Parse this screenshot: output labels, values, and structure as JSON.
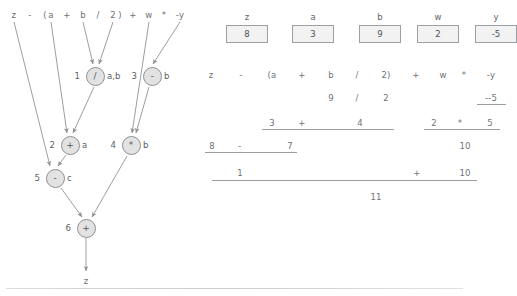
{
  "expression": {
    "text": "z - (a + b / 2) + w * -y",
    "tokens": [
      {
        "text": "z",
        "x": 14,
        "y": 15
      },
      {
        "text": "-",
        "x": 30,
        "y": 15
      },
      {
        "text": "(",
        "x": 45,
        "y": 15
      },
      {
        "text": "a",
        "x": 51,
        "y": 15
      },
      {
        "text": "+",
        "x": 67,
        "y": 15
      },
      {
        "text": "b",
        "x": 83,
        "y": 15
      },
      {
        "text": "/",
        "x": 98,
        "y": 15
      },
      {
        "text": "2",
        "x": 113,
        "y": 15
      },
      {
        "text": ")",
        "x": 120,
        "y": 15
      },
      {
        "text": "+",
        "x": 133,
        "y": 15
      },
      {
        "text": "w",
        "x": 149,
        "y": 15
      },
      {
        "text": "*",
        "x": 164,
        "y": 15
      },
      {
        "text": "-y",
        "x": 180,
        "y": 15
      }
    ]
  },
  "graph": {
    "nodes": [
      {
        "index": "1",
        "op": "/",
        "label": "a,b",
        "x": 95,
        "y": 76
      },
      {
        "index": "2",
        "op": "+",
        "label": "a",
        "x": 70,
        "y": 145
      },
      {
        "index": "3",
        "op": "-",
        "label": "b",
        "x": 152,
        "y": 76
      },
      {
        "index": "4",
        "op": "*",
        "label": "b",
        "x": 131,
        "y": 145
      },
      {
        "index": "5",
        "op": "-",
        "label": "c",
        "x": 55,
        "y": 178
      },
      {
        "index": "6",
        "op": "+",
        "label": "",
        "x": 86,
        "y": 228
      }
    ],
    "output_label": "z"
  },
  "variables": [
    {
      "name": "z",
      "value": "8",
      "cx": 47
    },
    {
      "name": "a",
      "value": "3",
      "cx": 113
    },
    {
      "name": "b",
      "value": "9",
      "cx": 180
    },
    {
      "name": "w",
      "value": "2",
      "cx": 238
    },
    {
      "name": "y",
      "value": "-5",
      "cx": 296
    }
  ],
  "evaluation": {
    "rows": [
      {
        "name": "source-expression",
        "tokens": [
          {
            "text": "z",
            "x": 11,
            "y": 75
          },
          {
            "text": "-",
            "x": 41,
            "y": 75
          },
          {
            "text": "(a",
            "x": 72,
            "y": 75
          },
          {
            "text": "+",
            "x": 102,
            "y": 75
          },
          {
            "text": "b",
            "x": 131,
            "y": 75
          },
          {
            "text": "/",
            "x": 157,
            "y": 75
          },
          {
            "text": "2)",
            "x": 186,
            "y": 75
          },
          {
            "text": "+",
            "x": 216,
            "y": 75
          },
          {
            "text": "w",
            "x": 243,
            "y": 75
          },
          {
            "text": "*",
            "x": 264,
            "y": 75
          },
          {
            "text": "-y",
            "x": 291,
            "y": 75
          }
        ]
      },
      {
        "name": "step-1",
        "tokens": [
          {
            "text": "9",
            "x": 131,
            "y": 98
          },
          {
            "text": "/",
            "x": 157,
            "y": 98
          },
          {
            "text": "2",
            "x": 186,
            "y": 98
          },
          {
            "text": "--5",
            "x": 291,
            "y": 98
          }
        ],
        "rules": [
          {
            "x": 277,
            "y": 104,
            "w": 29
          }
        ]
      },
      {
        "name": "step-2",
        "tokens": [
          {
            "text": "3",
            "x": 72,
            "y": 123
          },
          {
            "text": "+",
            "x": 102,
            "y": 123
          },
          {
            "text": "4",
            "x": 160,
            "y": 123
          },
          {
            "text": "2",
            "x": 234,
            "y": 123
          },
          {
            "text": "*",
            "x": 260,
            "y": 123
          },
          {
            "text": "5",
            "x": 290,
            "y": 123
          }
        ],
        "rules": [
          {
            "x": 62,
            "y": 129,
            "w": 132
          },
          {
            "x": 224,
            "y": 129,
            "w": 76
          }
        ]
      },
      {
        "name": "step-3",
        "tokens": [
          {
            "text": "8",
            "x": 12,
            "y": 146
          },
          {
            "text": "-",
            "x": 40,
            "y": 146
          },
          {
            "text": "7",
            "x": 90,
            "y": 146
          },
          {
            "text": "10",
            "x": 265,
            "y": 146
          }
        ],
        "rules": [
          {
            "x": 5,
            "y": 152,
            "w": 92
          }
        ]
      },
      {
        "name": "step-4",
        "tokens": [
          {
            "text": "1",
            "x": 40,
            "y": 173
          },
          {
            "text": "+",
            "x": 217,
            "y": 173
          },
          {
            "text": "10",
            "x": 265,
            "y": 173
          }
        ],
        "rules": [
          {
            "x": 12,
            "y": 180,
            "w": 265
          }
        ]
      },
      {
        "name": "result",
        "tokens": [
          {
            "text": "11",
            "x": 176,
            "y": 197
          }
        ]
      }
    ]
  },
  "colors": {
    "node_fill": "#e2e2e2",
    "node_stroke": "#8d9195",
    "edge": "#8f9397",
    "text": "#5a5f63",
    "box_fill": "#f2f2f2",
    "box_stroke": "#9aa0a4"
  }
}
